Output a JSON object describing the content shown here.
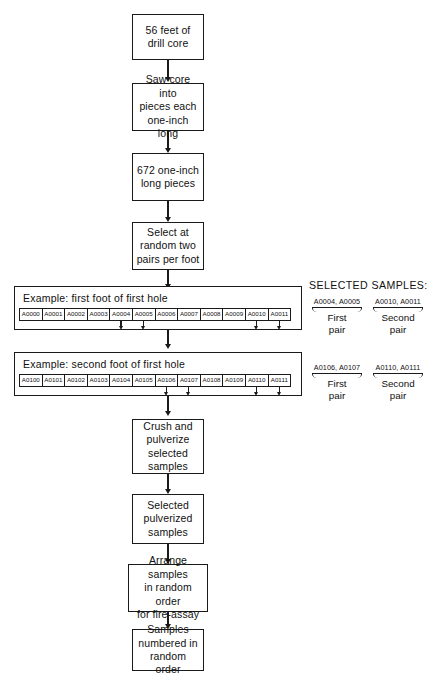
{
  "diagram": {
    "nodes": [
      {
        "id": "n1",
        "label": "56  feet of\ndrill core"
      },
      {
        "id": "n2",
        "label": "Saw core into\npieces each\none-inch long"
      },
      {
        "id": "n3",
        "label": "672 one-inch\nlong pieces"
      },
      {
        "id": "n4",
        "label": "Select at\nrandom two\npairs per foot"
      },
      {
        "id": "n5",
        "label": "Crush and\npulverize\nselected\nsamples"
      },
      {
        "id": "n6",
        "label": "Selected\npulverized\nsamples"
      },
      {
        "id": "n7",
        "label": "Arrange samples\nin random order\nfor fire-assay"
      },
      {
        "id": "n8",
        "label": "Samples\nnumbered in\nrandom order"
      }
    ],
    "examples": [
      {
        "id": "ex1",
        "title": "Example: first foot of first hole",
        "cells": [
          "A0000",
          "A0001",
          "A0002",
          "A0003",
          "A0004",
          "A0005",
          "A0006",
          "A0007",
          "A0008",
          "A0009",
          "A0010",
          "A0011"
        ],
        "marked": [
          4,
          5,
          10,
          11
        ]
      },
      {
        "id": "ex2",
        "title": "Example: second foot of first hole",
        "cells": [
          "A0100",
          "A0101",
          "A0102",
          "A0103",
          "A0104",
          "A0105",
          "A0106",
          "A0107",
          "A0108",
          "A0109",
          "A0110",
          "A0111"
        ],
        "marked": [
          6,
          7,
          10,
          11
        ]
      }
    ],
    "legend": {
      "title": "SELECTED  SAMPLES:",
      "groups": [
        {
          "row": "ex1",
          "pairs": [
            {
              "ids": "A0004, A0005",
              "caption": "First\npair"
            },
            {
              "ids": "A0010, A0011",
              "caption": "Second\npair"
            }
          ]
        },
        {
          "row": "ex2",
          "pairs": [
            {
              "ids": "A0106, A0107",
              "caption": "First\npair"
            },
            {
              "ids": "A0110, A0111",
              "caption": "Second\npair"
            }
          ]
        }
      ]
    },
    "colors": {
      "ink": "#1a1a1a",
      "background": "#ffffff"
    }
  }
}
